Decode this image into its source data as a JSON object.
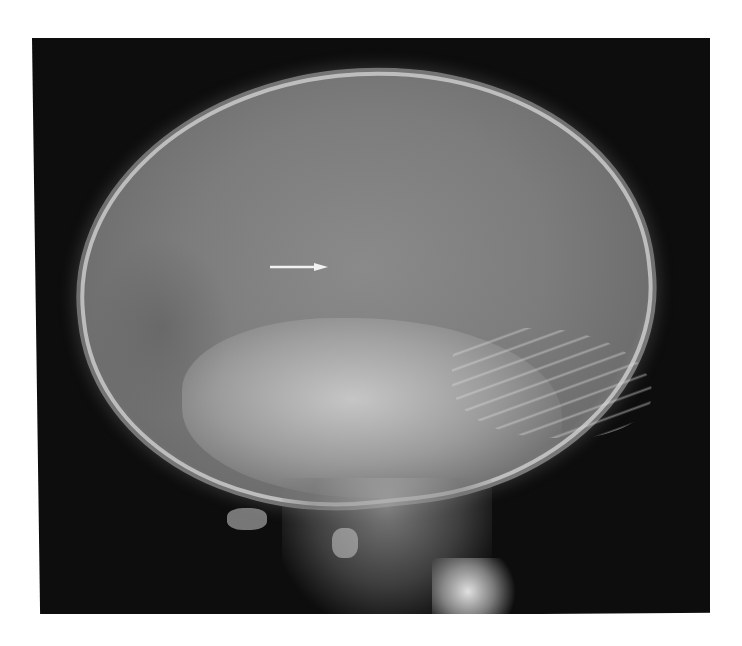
{
  "image": {
    "type": "lateral skull radiograph",
    "background_color": "#ffffff",
    "film_color": "#0d0d0d",
    "bone_color": "#c8c8c8",
    "annotation": {
      "type": "arrow",
      "direction": "right",
      "color": "#f2f2f2"
    }
  }
}
